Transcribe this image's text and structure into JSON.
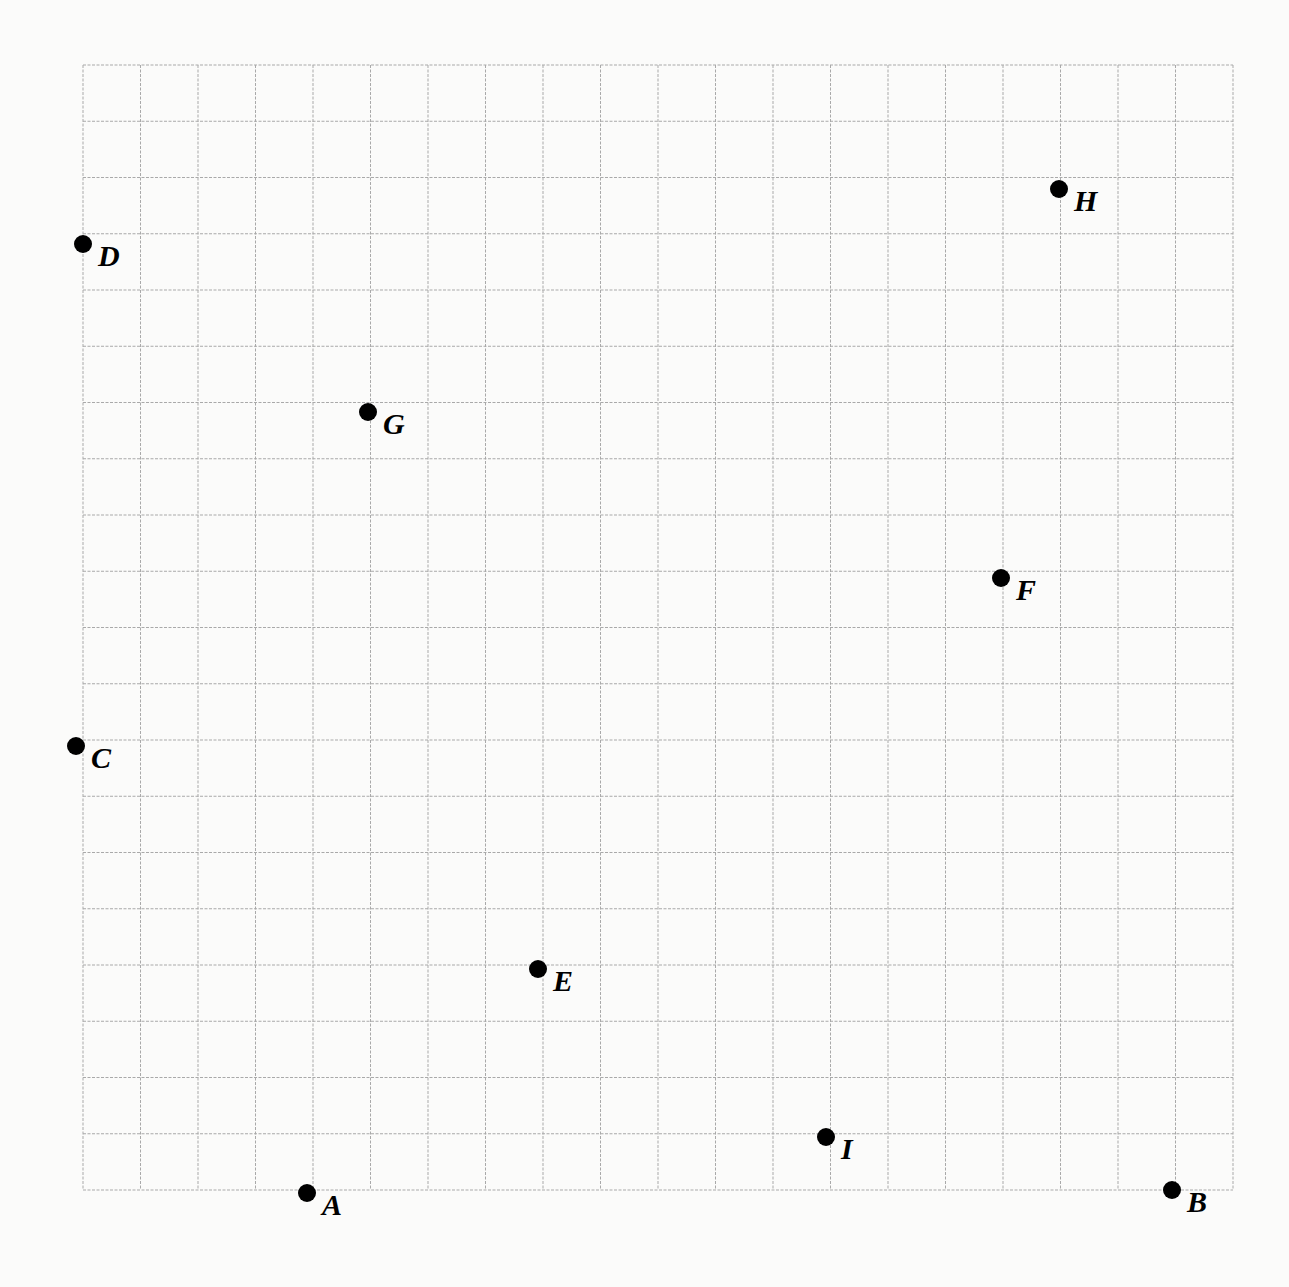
{
  "grid": {
    "left": 83,
    "top": 65,
    "right": 1233,
    "bottom": 1190,
    "columns": 20,
    "rows": 20,
    "line_color": "#a9a9a9"
  },
  "chart_data": {
    "type": "scatter",
    "title": "",
    "xlabel": "",
    "ylabel": "",
    "grid": true,
    "xlim": [
      0,
      20
    ],
    "ylim": [
      0,
      20
    ],
    "note": "Unlabeled 20x20 coordinate grid; x counted from left edge, y counted from bottom edge (in grid units).",
    "points": [
      {
        "label": "A",
        "x": 4,
        "y": 0
      },
      {
        "label": "B",
        "x": 19,
        "y": 0
      },
      {
        "label": "C",
        "x": 0,
        "y": 8
      },
      {
        "label": "D",
        "x": 0,
        "y": 17
      },
      {
        "label": "E",
        "x": 8,
        "y": 4
      },
      {
        "label": "F",
        "x": 16,
        "y": 11
      },
      {
        "label": "G",
        "x": 5,
        "y": 14
      },
      {
        "label": "H",
        "x": 17,
        "y": 18
      },
      {
        "label": "I",
        "x": 13,
        "y": 1
      }
    ]
  },
  "points": [
    {
      "label": "A",
      "px": 307,
      "py": 1193
    },
    {
      "label": "B",
      "px": 1172,
      "py": 1190
    },
    {
      "label": "C",
      "px": 76,
      "py": 746
    },
    {
      "label": "D",
      "px": 83,
      "py": 244
    },
    {
      "label": "E",
      "px": 538,
      "py": 969
    },
    {
      "label": "F",
      "px": 1001,
      "py": 578
    },
    {
      "label": "G",
      "px": 368,
      "py": 412
    },
    {
      "label": "H",
      "px": 1059,
      "py": 189
    },
    {
      "label": "I",
      "px": 826,
      "py": 1137
    }
  ]
}
